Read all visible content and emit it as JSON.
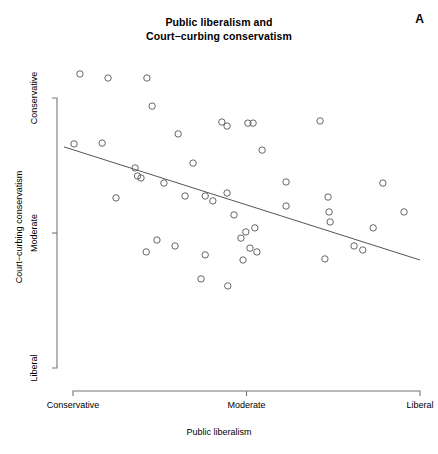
{
  "figure": {
    "panel_label": "A",
    "title_line1": "Public liberalism and",
    "title_line2": "Court−curbing conservatism",
    "background_color": "#ffffff",
    "point_color": "#555555",
    "line_color": "#555555",
    "axis_color": "#777777",
    "text_color": "#000000"
  },
  "chart_data": {
    "type": "scatter",
    "title": "Public liberalism and Court−curbing conservatism",
    "xlabel": "Public liberalism",
    "ylabel": "Court−curbing conservatism",
    "xlim": [
      0,
      1
    ],
    "ylim": [
      0,
      1
    ],
    "grid": false,
    "legend": null,
    "xticks": [
      {
        "value": 0,
        "label": "Conservative"
      },
      {
        "value": 0.5,
        "label": "Moderate"
      },
      {
        "value": 1,
        "label": "Liberal"
      }
    ],
    "yticks": [
      {
        "value": 1,
        "label": "Conservative"
      },
      {
        "value": 0.5,
        "label": "Moderate"
      },
      {
        "value": 0,
        "label": "Liberal"
      }
    ],
    "marker": "open-circle",
    "marker_size": 3.2,
    "points": [
      {
        "x": 0.02,
        "y": 1.089
      },
      {
        "x": 0.101,
        "y": 1.074
      },
      {
        "x": 0.213,
        "y": 1.074
      },
      {
        "x": 0.228,
        "y": 0.97
      },
      {
        "x": 0.003,
        "y": 0.83
      },
      {
        "x": 0.084,
        "y": 0.833
      },
      {
        "x": 0.429,
        "y": 0.911
      },
      {
        "x": 0.444,
        "y": 0.896
      },
      {
        "x": 0.504,
        "y": 0.907
      },
      {
        "x": 0.519,
        "y": 0.907
      },
      {
        "x": 0.712,
        "y": 0.915
      },
      {
        "x": 0.303,
        "y": 0.867
      },
      {
        "x": 0.545,
        "y": 0.807
      },
      {
        "x": 0.179,
        "y": 0.741
      },
      {
        "x": 0.346,
        "y": 0.759
      },
      {
        "x": 0.186,
        "y": 0.711
      },
      {
        "x": 0.196,
        "y": 0.704
      },
      {
        "x": 0.262,
        "y": 0.685
      },
      {
        "x": 0.614,
        "y": 0.689
      },
      {
        "x": 0.893,
        "y": 0.685
      },
      {
        "x": 0.124,
        "y": 0.63
      },
      {
        "x": 0.323,
        "y": 0.637
      },
      {
        "x": 0.381,
        "y": 0.637
      },
      {
        "x": 0.444,
        "y": 0.648
      },
      {
        "x": 0.403,
        "y": 0.619
      },
      {
        "x": 0.735,
        "y": 0.633
      },
      {
        "x": 0.614,
        "y": 0.6
      },
      {
        "x": 0.738,
        "y": 0.578
      },
      {
        "x": 0.954,
        "y": 0.578
      },
      {
        "x": 0.464,
        "y": 0.567
      },
      {
        "x": 0.741,
        "y": 0.541
      },
      {
        "x": 0.498,
        "y": 0.504
      },
      {
        "x": 0.524,
        "y": 0.519
      },
      {
        "x": 0.865,
        "y": 0.519
      },
      {
        "x": 0.484,
        "y": 0.481
      },
      {
        "x": 0.242,
        "y": 0.474
      },
      {
        "x": 0.211,
        "y": 0.43
      },
      {
        "x": 0.294,
        "y": 0.452
      },
      {
        "x": 0.381,
        "y": 0.419
      },
      {
        "x": 0.53,
        "y": 0.43
      },
      {
        "x": 0.49,
        "y": 0.4
      },
      {
        "x": 0.51,
        "y": 0.444
      },
      {
        "x": 0.81,
        "y": 0.452
      },
      {
        "x": 0.835,
        "y": 0.437
      },
      {
        "x": 0.726,
        "y": 0.404
      },
      {
        "x": 0.369,
        "y": 0.33
      },
      {
        "x": 0.446,
        "y": 0.304
      }
    ],
    "fit_line": {
      "label": "linear fit",
      "x_start": -0.026,
      "y_start": 0.819,
      "x_end": 1.0,
      "y_end": 0.4
    }
  }
}
